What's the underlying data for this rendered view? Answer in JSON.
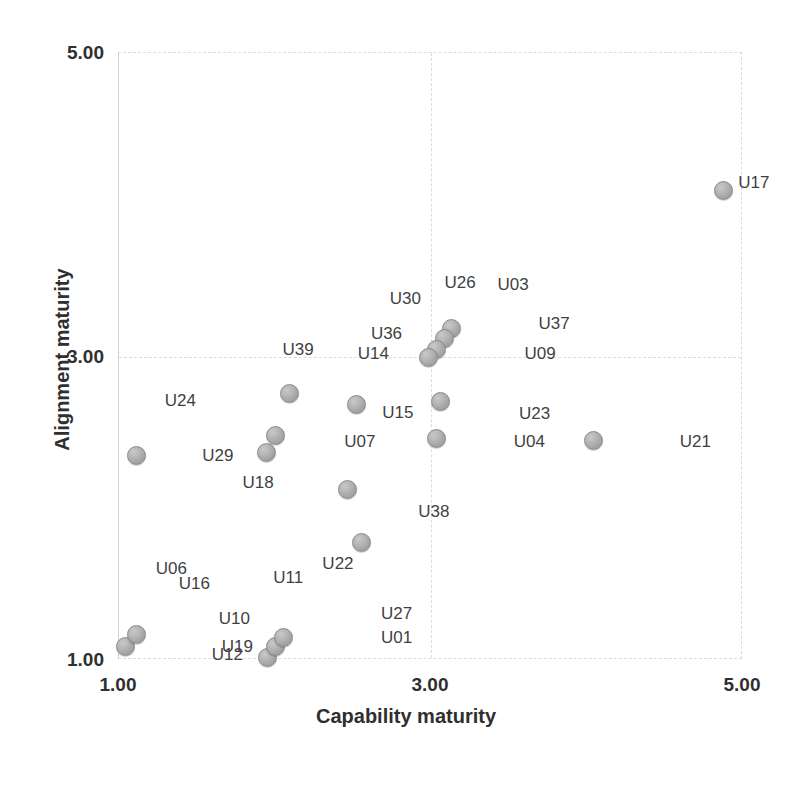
{
  "chart_data": {
    "type": "scatter",
    "title": "",
    "xlabel": "Capability maturity",
    "ylabel": "Alignment maturity",
    "xlim": [
      1.0,
      5.0
    ],
    "ylim": [
      1.0,
      5.0
    ],
    "xticks": [
      "1.00",
      "3.00",
      "5.00"
    ],
    "yticks": [
      "1.00",
      "3.00",
      "5.00"
    ],
    "xtick_values": [
      1.0,
      3.0,
      5.0
    ],
    "ytick_values": [
      1.0,
      3.0,
      5.0
    ],
    "grid": true,
    "legend": "none",
    "marker_color": "#b2b2b2",
    "marker_edge_color": "#8a8a8a",
    "points": [
      {
        "label": "U17",
        "x": 4.88,
        "y": 4.09,
        "lx": 15,
        "ly": -8
      },
      {
        "label": "U03",
        "x": 3.08,
        "y": 3.1,
        "lx": 55,
        "ly": -56
      },
      {
        "label": "U26",
        "x": 3.08,
        "y": 3.1,
        "lx": 2,
        "ly": -58
      },
      {
        "label": "U30",
        "x": 3.03,
        "y": 3.05,
        "lx": -45,
        "ly": -50
      },
      {
        "label": "U36",
        "x": 2.98,
        "y": 2.99,
        "lx": -56,
        "ly": -24
      },
      {
        "label": "U37",
        "x": 3.08,
        "y": 3.1,
        "lx": 96,
        "ly": -17
      },
      {
        "label": "U09",
        "x": 3.08,
        "y": 3.1,
        "lx": 82,
        "ly": 13
      },
      {
        "label": "U23",
        "x": 3.07,
        "y": 2.7,
        "lx": 78,
        "ly": 12
      },
      {
        "label": "U21",
        "x": 4.05,
        "y": 2.44,
        "lx": 86,
        "ly": 1
      },
      {
        "label": "U04",
        "x": 4.05,
        "y": 2.44,
        "lx": -80,
        "ly": 1
      },
      {
        "label": "U15",
        "x": 3.04,
        "y": 2.45,
        "lx": -54,
        "ly": -27
      },
      {
        "label": "U38",
        "x": 3.04,
        "y": 2.45,
        "lx": -18,
        "ly": 72
      },
      {
        "label": "U39",
        "x": 2.1,
        "y": 2.75,
        "lx": -7,
        "ly": -44
      },
      {
        "label": "U14",
        "x": 2.53,
        "y": 2.68,
        "lx": 1,
        "ly": -51
      },
      {
        "label": "U07",
        "x": 2.47,
        "y": 2.12,
        "lx": -3,
        "ly": -48
      },
      {
        "label": "U24",
        "x": 1.12,
        "y": 2.34,
        "lx": 28,
        "ly": -56
      },
      {
        "label": "U29",
        "x": 1.95,
        "y": 2.36,
        "lx": -64,
        "ly": 2
      },
      {
        "label": "U18",
        "x": 2.01,
        "y": 2.47,
        "lx": -33,
        "ly": 46
      },
      {
        "label": "U22",
        "x": 2.56,
        "y": 1.77,
        "lx": -39,
        "ly": 21
      },
      {
        "label": "U11",
        "x": 2.04,
        "y": 1.08,
        "lx": -7,
        "ly": -70
      },
      {
        "label": "U06",
        "x": 1.05,
        "y": 1.08,
        "lx": 30,
        "ly": -79
      },
      {
        "label": "U16",
        "x": 1.12,
        "y": 1.12,
        "lx": 42,
        "ly": -58
      },
      {
        "label": "U10",
        "x": 1.12,
        "y": 1.12,
        "lx": 82,
        "ly": -23
      },
      {
        "label": "U19",
        "x": 1.05,
        "y": 1.08,
        "lx": 96,
        "ly": -1
      },
      {
        "label": "U12",
        "x": 1.96,
        "y": 1.01,
        "lx": -56,
        "ly": -3
      },
      {
        "label": "U27",
        "x": 2.09,
        "y": 1.13,
        "lx": 93,
        "ly": -26
      },
      {
        "label": "U01",
        "x": 2.09,
        "y": 1.13,
        "lx": 93,
        "ly": -2
      }
    ],
    "markers": [
      {
        "x": 4.88,
        "y": 4.09
      },
      {
        "x": 3.14,
        "y": 3.18
      },
      {
        "x": 3.09,
        "y": 3.11
      },
      {
        "x": 3.04,
        "y": 3.04
      },
      {
        "x": 2.99,
        "y": 2.99
      },
      {
        "x": 3.07,
        "y": 2.7
      },
      {
        "x": 3.04,
        "y": 2.45
      },
      {
        "x": 4.05,
        "y": 2.44
      },
      {
        "x": 2.1,
        "y": 2.75
      },
      {
        "x": 2.53,
        "y": 2.68
      },
      {
        "x": 2.47,
        "y": 2.12
      },
      {
        "x": 1.12,
        "y": 2.34
      },
      {
        "x": 1.95,
        "y": 2.36
      },
      {
        "x": 2.01,
        "y": 2.47
      },
      {
        "x": 2.56,
        "y": 1.77
      },
      {
        "x": 1.05,
        "y": 1.08
      },
      {
        "x": 1.12,
        "y": 1.16
      },
      {
        "x": 1.96,
        "y": 1.01
      },
      {
        "x": 2.01,
        "y": 1.08
      },
      {
        "x": 2.06,
        "y": 1.14
      }
    ]
  },
  "axes": {
    "x_title": "Capability maturity",
    "y_title": "Alignment maturity"
  }
}
